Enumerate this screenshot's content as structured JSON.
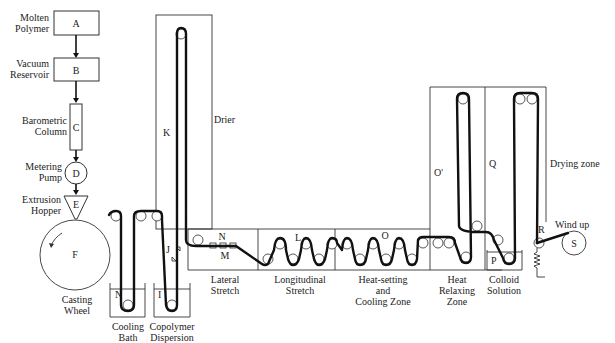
{
  "diagram": {
    "stages": {
      "A": {
        "tag": "A",
        "label": [
          "Molten",
          "Polymer"
        ]
      },
      "B": {
        "tag": "B",
        "label": [
          "Vacuum",
          "Reservoir"
        ]
      },
      "C": {
        "tag": "C",
        "label": [
          "Barometric",
          "Column"
        ]
      },
      "D": {
        "tag": "D",
        "label": [
          "Metering",
          "Pump"
        ]
      },
      "E": {
        "tag": "E",
        "label": [
          "Extrusion",
          "Hopper"
        ]
      },
      "F": {
        "tag": "F",
        "label": [
          "Casting",
          "Wheel"
        ]
      },
      "N_bath": {
        "tag": "N",
        "label": [
          "Cooling",
          "Bath"
        ]
      },
      "I": {
        "tag": "I",
        "label": [
          "Copolymer",
          "Dispersion"
        ]
      },
      "J": {
        "tag": "J"
      },
      "K": {
        "tag": "K",
        "label": [
          "Drier"
        ]
      },
      "N_lat": {
        "tag": "N"
      },
      "M": {
        "tag": "M",
        "label": [
          "Lateral",
          "Stretch"
        ]
      },
      "L": {
        "tag": "L",
        "label": [
          "Longitudinal",
          "Stretch"
        ]
      },
      "O": {
        "tag": "O",
        "label": [
          "Heat-setting",
          "and",
          "Cooling Zone"
        ]
      },
      "O_prime": {
        "tag": "O'",
        "label": [
          "Heat",
          "Relaxing",
          "Zone"
        ]
      },
      "P": {
        "tag": "P",
        "label": [
          "Colloid",
          "Solution"
        ]
      },
      "Q": {
        "tag": "Q",
        "label": [
          "Drying zone"
        ]
      },
      "R": {
        "tag": "R"
      },
      "S": {
        "tag": "S",
        "label": [
          "Wind up"
        ]
      }
    },
    "flow": [
      "A",
      "B",
      "C",
      "D",
      "E",
      "F",
      "N_bath",
      "I",
      "J",
      "K",
      "N_lat",
      "M",
      "L",
      "O",
      "O_prime",
      "P",
      "Q",
      "R",
      "S"
    ],
    "rotation_direction": "counterclockwise"
  }
}
